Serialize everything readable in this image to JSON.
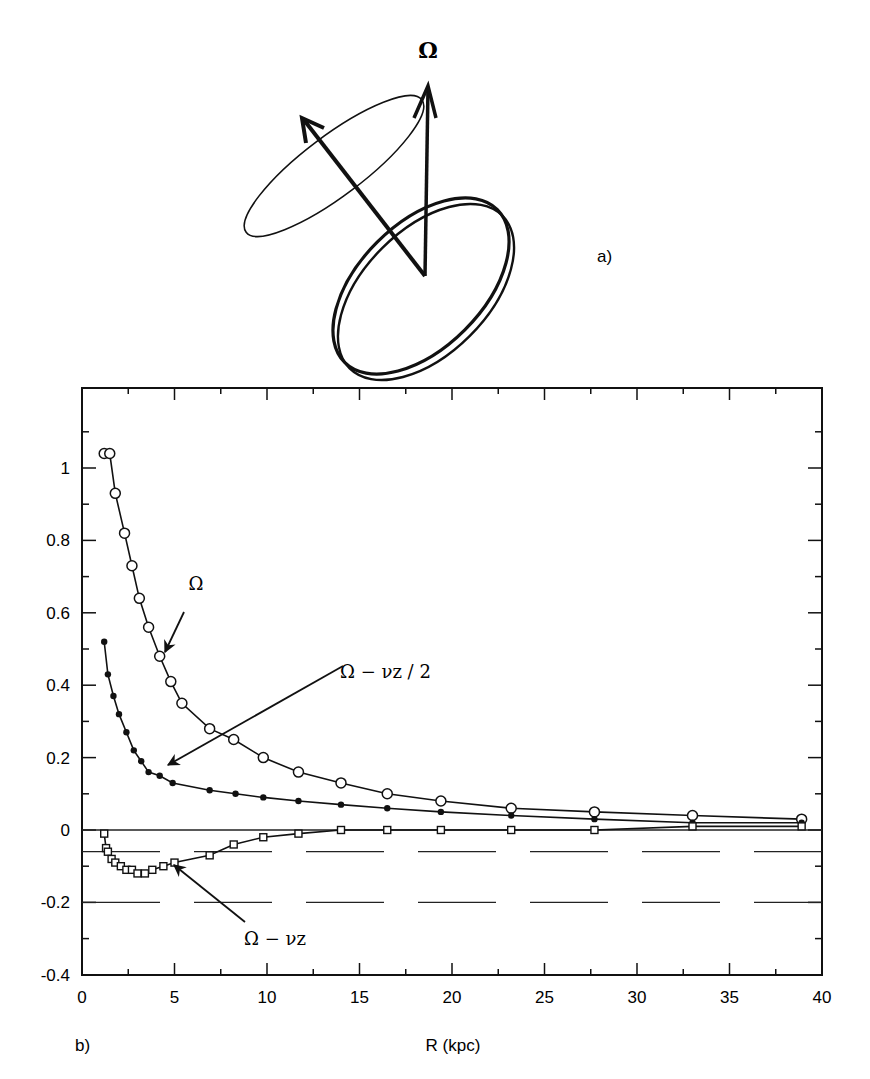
{
  "panel_a": {
    "label": "a)",
    "vector_label": "Ω"
  },
  "panel_b": {
    "label": "b)"
  },
  "chart_data": {
    "type": "line",
    "title": "",
    "xlabel": "R (kpc)",
    "ylabel": "",
    "xlim": [
      0,
      40
    ],
    "ylim": [
      -0.4,
      1.15
    ],
    "xticks": [
      0,
      5,
      10,
      15,
      20,
      25,
      30,
      35,
      40
    ],
    "xtick_labels": [
      "0",
      "5",
      "10",
      "15",
      "20",
      "25",
      "30",
      "35",
      "40"
    ],
    "yticks": [
      -0.4,
      -0.2,
      0,
      0.2,
      0.4,
      0.6,
      0.8,
      1
    ],
    "ytick_labels": [
      "-0.4",
      "-0.2",
      "0",
      "0.2",
      "0.4",
      "0.6",
      "0.8",
      "1"
    ],
    "grid": false,
    "legend": "none (curves labelled by arrows)",
    "series": [
      {
        "name": "Ω",
        "marker": "open-circle",
        "x": [
          1.2,
          1.5,
          1.8,
          2.3,
          2.7,
          3.1,
          3.6,
          4.2,
          4.8,
          5.4,
          6.9,
          8.2,
          9.8,
          11.7,
          14.0,
          16.5,
          19.4,
          23.2,
          27.7,
          33.0,
          38.9
        ],
        "y": [
          1.04,
          1.04,
          0.93,
          0.82,
          0.73,
          0.64,
          0.56,
          0.48,
          0.41,
          0.35,
          0.28,
          0.25,
          0.2,
          0.16,
          0.13,
          0.1,
          0.08,
          0.06,
          0.05,
          0.04,
          0.03
        ]
      },
      {
        "name": "Ω − νz / 2",
        "marker": "filled-dot",
        "x": [
          1.2,
          1.4,
          1.7,
          2.0,
          2.4,
          2.8,
          3.2,
          3.6,
          4.2,
          4.9,
          6.9,
          8.3,
          9.8,
          11.7,
          14.0,
          16.5,
          19.4,
          23.2,
          27.7,
          33.0,
          38.9
        ],
        "y": [
          0.52,
          0.43,
          0.37,
          0.32,
          0.27,
          0.22,
          0.19,
          0.16,
          0.15,
          0.13,
          0.11,
          0.1,
          0.09,
          0.08,
          0.07,
          0.06,
          0.05,
          0.04,
          0.03,
          0.02,
          0.02
        ]
      },
      {
        "name": "Ω − νz",
        "marker": "open-square",
        "x": [
          1.2,
          1.3,
          1.4,
          1.6,
          1.8,
          2.1,
          2.4,
          2.7,
          3.0,
          3.4,
          3.8,
          4.4,
          5.0,
          6.9,
          8.2,
          9.8,
          11.7,
          14.0,
          16.5,
          19.4,
          23.2,
          27.7,
          33.0,
          38.9
        ],
        "y": [
          -0.01,
          -0.05,
          -0.06,
          -0.08,
          -0.09,
          -0.1,
          -0.11,
          -0.11,
          -0.12,
          -0.12,
          -0.11,
          -0.1,
          -0.09,
          -0.07,
          -0.04,
          -0.02,
          -0.01,
          0.0,
          0.0,
          0.0,
          0.0,
          0.0,
          0.01,
          0.01
        ]
      }
    ],
    "reference_lines": [
      {
        "y": 0,
        "style": "solid"
      },
      {
        "y": -0.06,
        "style": "dashed"
      },
      {
        "y": -0.2,
        "style": "dashed"
      }
    ],
    "annotations": [
      {
        "text": "Ω",
        "points_to_series": "Ω"
      },
      {
        "text": "Ω − νz / 2",
        "points_to_series": "Ω − νz / 2"
      },
      {
        "text": "Ω − νz",
        "points_to_series": "Ω − νz"
      }
    ]
  }
}
